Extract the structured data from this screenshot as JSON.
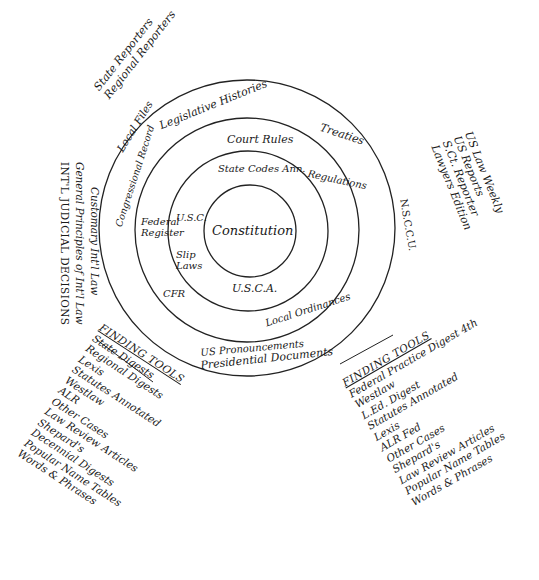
{
  "rings": {
    "center": "Constitution",
    "ring_1": [
      "U.S.C.",
      "Slip Laws",
      "U.S.C.A.",
      "State Codes Ann."
    ],
    "ring_2": [
      "Court Rules",
      "Regulations",
      "Federal Register",
      "CFR",
      "Local Ordinances"
    ],
    "ring_3": [
      "Legislative Histories",
      "Treaties",
      "Congressional Record",
      "US Pronouncements"
    ],
    "ring_4": [
      "Presidential Documents",
      "Local Files"
    ]
  },
  "outside": {
    "reporters_top_left": [
      "State Reporters",
      "Regional Reporters"
    ],
    "reporters_right": [
      "US Law Weekly",
      "US Reports",
      "S.Ct. Reporter",
      "Lawyers Edition"
    ],
    "nscc": "N.S.C.C.U.",
    "intl": [
      "Customary Int'l Law",
      "General Principles of Int'l Law",
      "INT'L JUDICIAL DECISIONS"
    ]
  },
  "finding_tools_left": {
    "title": "FINDING TOOLS",
    "items": [
      "State Digests",
      "Regional Digests",
      "Lexis",
      "Statutes Annotated",
      "Westlaw",
      "ALR",
      "Other Cases",
      "Law Review Articles",
      "Shepard's",
      "Decennial Digests",
      "Popular Name Tables",
      "Words & Phrases"
    ]
  },
  "finding_tools_right": {
    "title": "FINDING TOOLS",
    "items": [
      "Federal Practice Digest 4th",
      "Westlaw",
      "L.Ed. Digest",
      "Statutes Annotated",
      "Lexis",
      "ALR Fed",
      "Other Cases",
      "Shepard's",
      "Law Review Articles",
      "Popular Name Tables",
      "Words & Phrases"
    ]
  }
}
